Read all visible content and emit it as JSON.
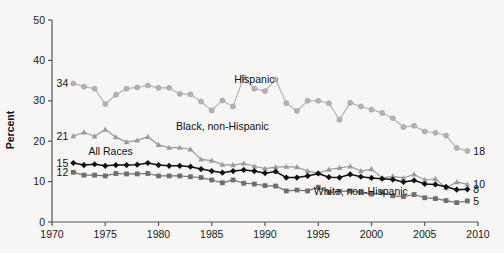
{
  "chart_data": {
    "type": "line",
    "title": "",
    "xlabel": "",
    "ylabel": "Percent",
    "xlim": [
      1970,
      2010
    ],
    "ylim": [
      0,
      50
    ],
    "xticks": [
      1970,
      1975,
      1980,
      1985,
      1990,
      1995,
      2000,
      2005,
      2010
    ],
    "yticks": [
      0,
      10,
      20,
      30,
      40,
      50
    ],
    "grid": false,
    "legend_position": "inline-annotations",
    "x": [
      1972,
      1973,
      1974,
      1975,
      1976,
      1977,
      1978,
      1979,
      1980,
      1981,
      1982,
      1983,
      1984,
      1985,
      1986,
      1987,
      1988,
      1989,
      1990,
      1991,
      1992,
      1993,
      1994,
      1995,
      1996,
      1997,
      1998,
      1999,
      2000,
      2001,
      2002,
      2003,
      2004,
      2005,
      2006,
      2007,
      2008,
      2009
    ],
    "series": [
      {
        "name": "Hispanic",
        "marker": "circle",
        "color": "#b4b4b4",
        "start_label": "34",
        "end_label": "18",
        "label_x": 1989,
        "label_y": 34.5,
        "values": [
          34.3,
          33.5,
          33.0,
          29.2,
          31.5,
          33.0,
          33.3,
          33.8,
          33.2,
          33.2,
          31.7,
          31.6,
          29.8,
          27.6,
          30.1,
          28.6,
          35.8,
          33.0,
          32.4,
          35.3,
          29.4,
          27.5,
          30.0,
          30.0,
          29.4,
          25.3,
          29.5,
          28.6,
          27.8,
          27.0,
          25.7,
          23.5,
          23.8,
          22.4,
          22.1,
          21.4,
          18.3,
          17.6
        ]
      },
      {
        "name": "Black, non-Hispanic",
        "marker": "triangle",
        "color": "#9a9a9a",
        "start_label": "21",
        "end_label": "10",
        "label_x": 1986,
        "label_y": 22.8,
        "values": [
          21.3,
          22.2,
          21.2,
          22.9,
          21.0,
          19.8,
          20.2,
          21.1,
          19.1,
          18.4,
          18.4,
          18.0,
          15.5,
          15.2,
          14.2,
          14.1,
          14.5,
          13.8,
          13.2,
          13.6,
          13.7,
          13.6,
          12.6,
          12.1,
          13.0,
          13.4,
          13.8,
          12.6,
          13.1,
          10.9,
          11.3,
          10.9,
          11.8,
          10.4,
          10.7,
          8.4,
          9.9,
          9.3
        ]
      },
      {
        "name": "All Races",
        "marker": "diamond",
        "color": "#111111",
        "start_label": "15",
        "end_label": "8",
        "label_x": 1975.5,
        "label_y": 16.6,
        "values": [
          14.6,
          14.1,
          14.3,
          13.9,
          14.1,
          14.1,
          14.2,
          14.6,
          14.1,
          13.9,
          13.9,
          13.7,
          13.1,
          12.6,
          12.2,
          12.6,
          12.9,
          12.6,
          12.1,
          12.5,
          11.0,
          11.0,
          11.4,
          12.0,
          11.1,
          11.0,
          11.8,
          11.2,
          10.9,
          10.7,
          10.5,
          9.9,
          10.3,
          9.4,
          9.3,
          8.7,
          8.0,
          8.1
        ]
      },
      {
        "name": "White, non-Hispanic",
        "marker": "square",
        "color": "#6e6e6e",
        "start_label": "12",
        "end_label": "5",
        "label_x": 1999,
        "label_y": 6.6,
        "values": [
          12.3,
          11.6,
          11.6,
          11.4,
          12.0,
          11.9,
          11.9,
          12.0,
          11.4,
          11.4,
          11.4,
          11.2,
          11.0,
          10.4,
          9.7,
          10.4,
          9.6,
          9.4,
          9.0,
          8.9,
          7.7,
          7.9,
          7.7,
          8.6,
          7.3,
          7.6,
          7.7,
          7.3,
          6.9,
          7.3,
          6.5,
          6.3,
          6.8,
          6.0,
          5.8,
          5.3,
          4.8,
          5.2
        ]
      }
    ]
  },
  "axes": {
    "x_tick_labels": [
      "1970",
      "1975",
      "1980",
      "1985",
      "1990",
      "1995",
      "2000",
      "2005",
      "2010"
    ],
    "y_tick_labels": [
      "0",
      "10",
      "20",
      "30",
      "40",
      "50"
    ],
    "y_axis_title": "Percent"
  }
}
